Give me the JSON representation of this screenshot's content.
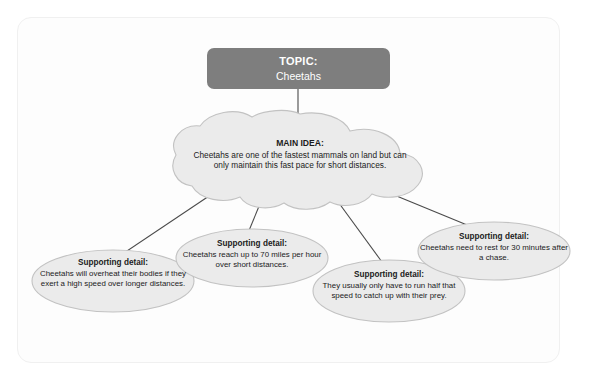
{
  "diagram": {
    "type": "concept-map",
    "topic": {
      "title": "TOPIC:",
      "subject": "Cheetahs"
    },
    "main_idea": {
      "header": "MAIN IDEA:",
      "body": "Cheetahs are one of the fastest mammals on land but can only maintain this fast pace for short distances."
    },
    "details": [
      {
        "header": "Supporting detail:",
        "body": "Cheetahs will overheat their bodies if they exert a high speed over longer distances."
      },
      {
        "header": "Supporting detail:",
        "body": "Cheetahs reach up to 70 miles per hour over short distances."
      },
      {
        "header": "Supporting detail:",
        "body": "They usually only have to run half that speed to catch up with their prey."
      },
      {
        "header": "Supporting detail:",
        "body": "Cheetahs need to rest for 30 minutes after a chase."
      }
    ],
    "colors": {
      "topic_fill": "#7e7e7e",
      "topic_text": "#ffffff",
      "shape_fill": "#ebebeb",
      "shape_stroke": "#c2c2c2",
      "connector": "#4a4a4a",
      "body_text": "#1b1b1b",
      "frame_border": "#f0f0f0",
      "page_background": "#ffffff"
    }
  }
}
